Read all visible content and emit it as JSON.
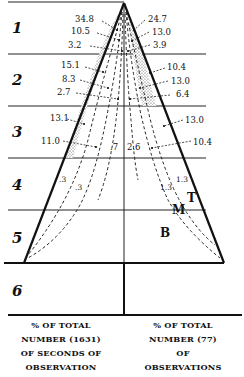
{
  "zones": [
    "1",
    "2",
    "3",
    "4",
    "5",
    "6"
  ],
  "left_values": {
    "zone1": [
      "34.8",
      "10.5",
      "3.2"
    ],
    "zone2": [
      "15.1",
      "8.3",
      "2.7"
    ],
    "zone3": [
      "13.1",
      "11.0",
      ".7"
    ],
    "zone4": [
      ".3",
      ".3"
    ]
  },
  "right_values": {
    "zone1": [
      "24.7",
      "13.0",
      "3.9"
    ],
    "zone2": [
      "10.4",
      "13.0",
      "6.4"
    ],
    "zone3": [
      "13.0",
      "10.4",
      "2.6"
    ],
    "zone4": [
      "1.3",
      "1.3"
    ]
  },
  "curve_labels": {
    "top": "T",
    "middle": "M",
    "bottom": "B"
  },
  "captions": {
    "left": [
      "% OF TOTAL",
      "NUMBER (1631)",
      "OF SECONDS OF",
      "OBSERVATION"
    ],
    "right": [
      "% OF TOTAL",
      "NUMBER (77)",
      "OF",
      "OBSERVATIONS"
    ]
  }
}
